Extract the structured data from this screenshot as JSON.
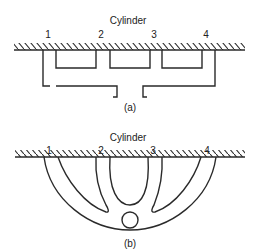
{
  "figure_a": {
    "title": "Cylinder",
    "ports": [
      "1",
      "2",
      "3",
      "4"
    ],
    "caption": "(a)"
  },
  "figure_b": {
    "title": "Cylinder",
    "ports": [
      "1",
      "2",
      "3",
      "4"
    ],
    "caption": "(b)"
  }
}
